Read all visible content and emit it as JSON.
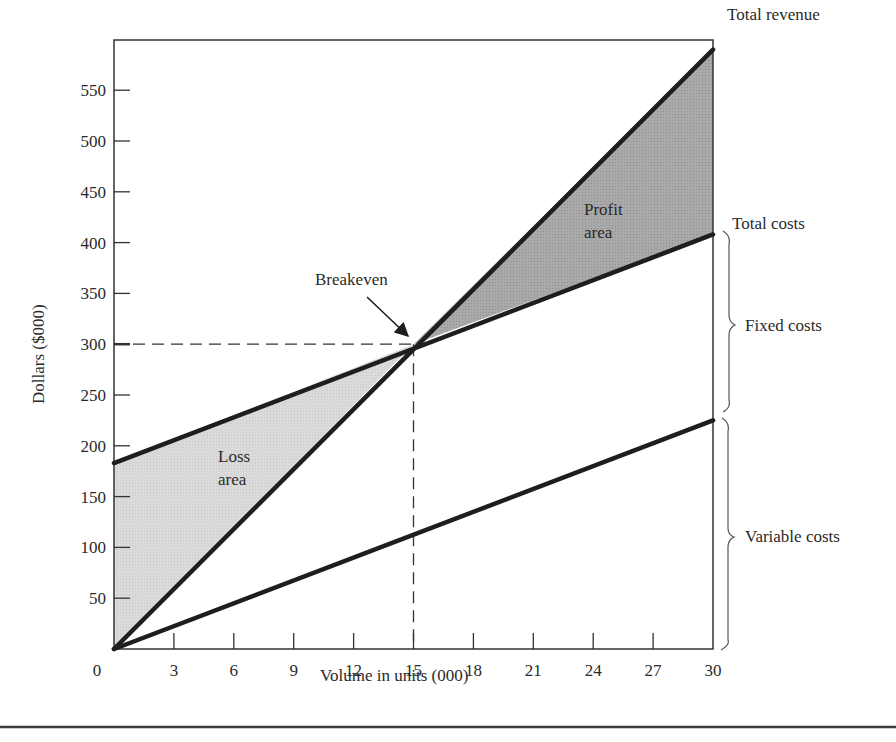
{
  "chart_data": {
    "type": "line",
    "title": "",
    "xlabel": "Volume in units (000)",
    "ylabel": "Dollars ($000)",
    "xlim": [
      0,
      30
    ],
    "ylim": [
      0,
      590
    ],
    "x_ticks": [
      0,
      3,
      6,
      9,
      12,
      15,
      18,
      21,
      24,
      27,
      30
    ],
    "y_ticks": [
      50,
      100,
      150,
      200,
      250,
      300,
      350,
      400,
      450,
      500,
      550
    ],
    "origin_label": "0",
    "grid": false,
    "legend": "none (lines labeled at right edge)",
    "series": [
      {
        "name": "Total revenue",
        "x": [
          0,
          30
        ],
        "values": [
          0,
          590
        ]
      },
      {
        "name": "Total costs",
        "x": [
          0,
          30
        ],
        "values": [
          183,
          408
        ]
      },
      {
        "name": "Variable costs",
        "x": [
          0,
          30
        ],
        "values": [
          0,
          225
        ]
      }
    ],
    "breakeven": {
      "x": 15,
      "y": 300,
      "label": "Breakeven"
    },
    "regions": [
      {
        "name": "Loss area",
        "label_lines": [
          "Loss",
          "area"
        ],
        "bounds": "between Total costs (above) and Total revenue (below), x 0–15",
        "fill": "#d9d9d9"
      },
      {
        "name": "Profit area",
        "label_lines": [
          "Profit",
          "area"
        ],
        "bounds": "between Total revenue (above) and Total costs (below), x 15–30",
        "fill": "#a6a6a6"
      }
    ],
    "right_labels": [
      {
        "text": "Total revenue"
      },
      {
        "text": "Total costs"
      },
      {
        "text": "Fixed costs",
        "bracket": "from Total costs down to Variable costs at x=30"
      },
      {
        "text": "Variable costs",
        "bracket": "from Variable costs down to 0 at x=30"
      }
    ]
  },
  "colors": {
    "line": "#1e1e1e",
    "axis": "#333333",
    "loss_fill": "#d9d9d9",
    "profit_fill": "#a6a6a6",
    "text": "#2a2a2a"
  },
  "layout": {
    "plot": {
      "x0": 114,
      "x1": 713,
      "y_top": 40,
      "y_zero": 649
    },
    "px_per_x": 19.967,
    "px_per_y": 1.016
  }
}
